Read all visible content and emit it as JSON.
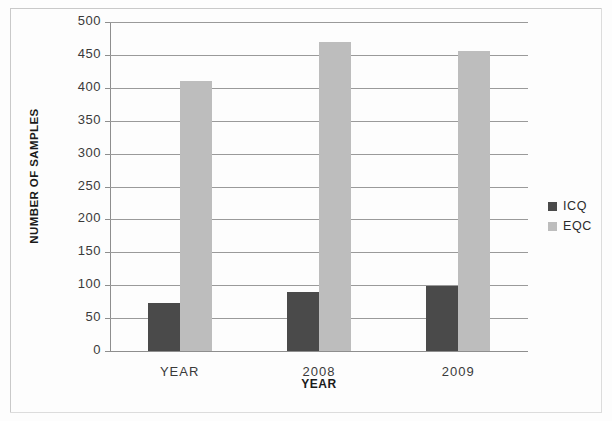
{
  "chart_data": {
    "type": "bar",
    "title": "",
    "subtitle": "",
    "xlabel": "YEAR",
    "ylabel": "NUMBER OF SAMPLES",
    "categories": [
      "YEAR",
      "2008",
      "2009"
    ],
    "series": [
      {
        "name": "ICQ",
        "color": "#4a4a4a",
        "values": [
          73,
          90,
          99
        ]
      },
      {
        "name": "EQC",
        "color": "#bdbdbd",
        "values": [
          410,
          470,
          456
        ]
      }
    ],
    "ylim": [
      0,
      500
    ],
    "ytick_step": 50,
    "yticks": [
      "500",
      "450",
      "400",
      "350",
      "300",
      "250",
      "200",
      "150",
      "100",
      "50",
      "0"
    ],
    "grid": true,
    "grid_axis": "y",
    "legend_position": "right",
    "legend": [
      "ICQ",
      "EQC"
    ]
  },
  "axes": {
    "y_title": "NUMBER OF SAMPLES",
    "x_title": "YEAR"
  },
  "legend": {
    "items": [
      {
        "label": "ICQ",
        "color": "#4a4a4a"
      },
      {
        "label": "EQC",
        "color": "#bdbdbd"
      }
    ]
  }
}
